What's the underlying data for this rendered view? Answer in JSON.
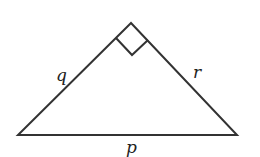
{
  "diagram": {
    "type": "right-triangle",
    "stroke_color": "#333333",
    "vertices": {
      "apex": [
        131,
        23
      ],
      "left": [
        18,
        135
      ],
      "right": [
        237,
        135
      ]
    },
    "right_angle_at": "apex",
    "sides": {
      "left": {
        "label": "q"
      },
      "right": {
        "label": "r"
      },
      "base": {
        "label": "p"
      }
    }
  }
}
